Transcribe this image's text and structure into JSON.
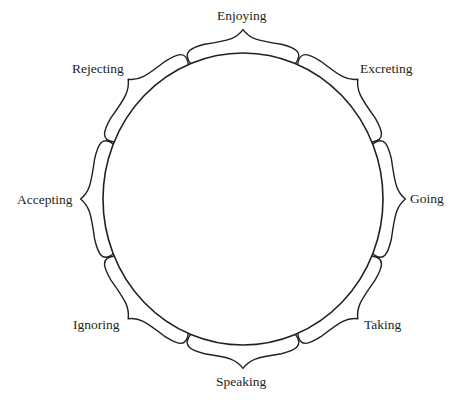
{
  "diagram": {
    "type": "circle-with-petal-braces",
    "center": [
      243,
      199
    ],
    "radius_x": 140,
    "radius_y": 146,
    "stroke_color": "#231f20",
    "background": "#ffffff",
    "labels": [
      {
        "id": "enjoying",
        "text": "Enjoying",
        "angle": 0
      },
      {
        "id": "excreting",
        "text": "Excreting",
        "angle": 45
      },
      {
        "id": "going",
        "text": "Going",
        "angle": 90
      },
      {
        "id": "taking",
        "text": "Taking",
        "angle": 135
      },
      {
        "id": "speaking",
        "text": "Speaking",
        "angle": 180
      },
      {
        "id": "ignoring",
        "text": "Ignoring",
        "angle": 225
      },
      {
        "id": "accepting",
        "text": "Accepting",
        "angle": 270
      },
      {
        "id": "rejecting",
        "text": "Rejecting",
        "angle": 315
      }
    ]
  }
}
